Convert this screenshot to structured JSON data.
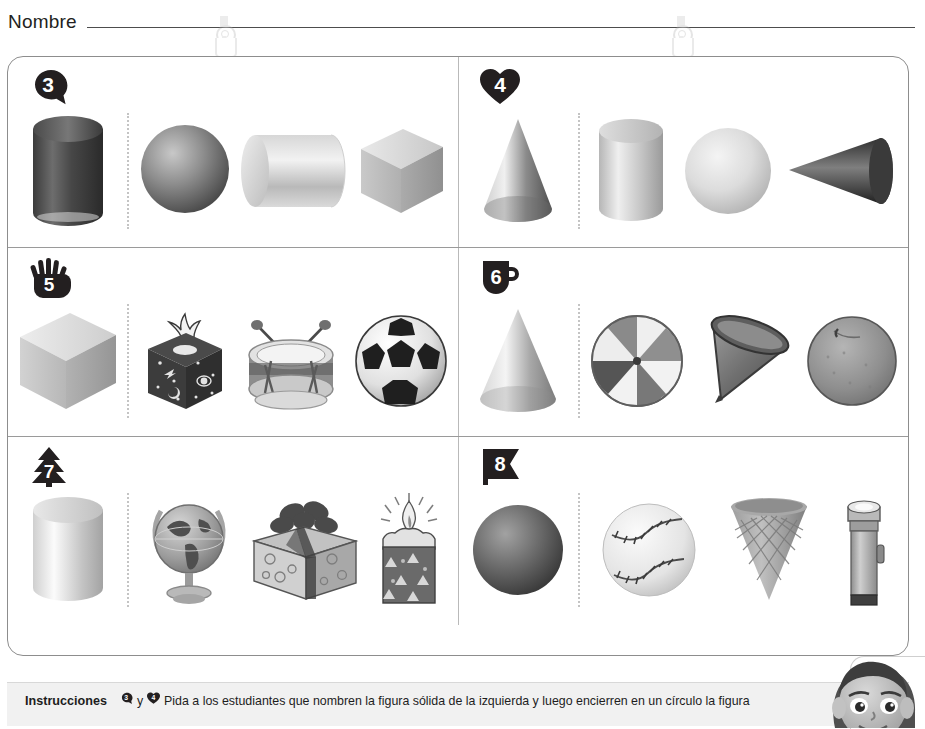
{
  "page": {
    "name_label": "Nombre",
    "clip_left_icon": "binder-clip-icon",
    "clip_right_icon": "binder-clip-icon"
  },
  "worksheet": {
    "rows": [
      {
        "left": {
          "number": "3",
          "badge_shape": "fish",
          "prompt": {
            "name": "cylinder-dark",
            "label": "cilindro"
          },
          "choices": [
            {
              "name": "sphere",
              "label": "esfera"
            },
            {
              "name": "cylinder-horizontal",
              "label": "cilindro horizontal"
            },
            {
              "name": "cube",
              "label": "cubo"
            }
          ]
        },
        "right": {
          "number": "4",
          "badge_shape": "heart",
          "prompt": {
            "name": "cone",
            "label": "cono"
          },
          "choices": [
            {
              "name": "cylinder",
              "label": "cilindro"
            },
            {
              "name": "sphere",
              "label": "esfera"
            },
            {
              "name": "cone-sideways",
              "label": "cono acostado"
            }
          ]
        }
      },
      {
        "left": {
          "number": "5",
          "badge_shape": "hand",
          "prompt": {
            "name": "cube",
            "label": "cubo"
          },
          "choices": [
            {
              "name": "tissue-box",
              "label": "caja de pañuelos"
            },
            {
              "name": "drum",
              "label": "tambor"
            },
            {
              "name": "soccer-ball",
              "label": "balón de fútbol"
            }
          ]
        },
        "right": {
          "number": "6",
          "badge_shape": "mug",
          "prompt": {
            "name": "cone",
            "label": "cono"
          },
          "choices": [
            {
              "name": "beach-ball",
              "label": "pelota de playa"
            },
            {
              "name": "paper-cone-cup",
              "label": "cono de papel"
            },
            {
              "name": "orange",
              "label": "naranja"
            }
          ]
        }
      },
      {
        "left": {
          "number": "7",
          "badge_shape": "tree",
          "prompt": {
            "name": "cylinder",
            "label": "cilindro"
          },
          "choices": [
            {
              "name": "globe",
              "label": "globo terráqueo"
            },
            {
              "name": "gift-box",
              "label": "caja de regalo"
            },
            {
              "name": "candle",
              "label": "vela"
            }
          ]
        },
        "right": {
          "number": "8",
          "badge_shape": "flag",
          "prompt": {
            "name": "sphere-dark",
            "label": "esfera"
          },
          "choices": [
            {
              "name": "baseball",
              "label": "pelota de béisbol"
            },
            {
              "name": "ice-cream-cone",
              "label": "cono de helado"
            },
            {
              "name": "flashlight",
              "label": "linterna"
            }
          ]
        }
      }
    ]
  },
  "instructions": {
    "title": "Instrucciones",
    "badge_a_number": "3",
    "conjunction": "y",
    "badge_b_number": "4",
    "text": "Pida a los estudiantes que nombren la figura sólida de la izquierda y luego encierren en un círculo la figura"
  },
  "colors": {
    "ink": "#231f20",
    "rule": "#4d4d4d",
    "panel_border": "#8d8d8d",
    "divider": "#b9b9b9",
    "dotted": "#c4c4c4",
    "instructions_bg": "#f1f1f1"
  }
}
